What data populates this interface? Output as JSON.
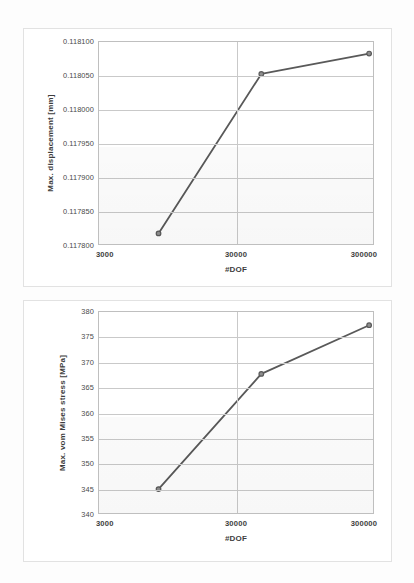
{
  "document": {
    "background_color": "#fdfdfd",
    "figure_count": 2
  },
  "chart_data": [
    {
      "id": "max-displacement-convergence",
      "type": "line",
      "title": "",
      "xlabel": "#DOF",
      "ylabel": "Max. displacement [mm]",
      "xscale": "log",
      "xlim": [
        3000,
        300000
      ],
      "ylim": [
        0.1178,
        0.1181
      ],
      "xticks": [
        3000,
        30000,
        300000
      ],
      "xtick_labels": [
        "3000",
        "30000",
        "300000"
      ],
      "yticks": [
        0.1178,
        0.11785,
        0.1179,
        0.11795,
        0.118,
        0.11805,
        0.1181
      ],
      "ytick_labels": [
        "0.117800",
        "0.117850",
        "0.117900",
        "0.117950",
        "0.118000",
        "0.118050",
        "0.118100"
      ],
      "grid": "horizontal-and-major-vertical",
      "legend": "none",
      "marker": "circle",
      "line_color": "#595959",
      "marker_color": "#595959",
      "series": [
        {
          "name": "Max. displacement",
          "x": [
            8100,
            45000,
            272000
          ],
          "y": [
            0.1178185,
            0.118053,
            0.118083
          ]
        }
      ]
    },
    {
      "id": "max-von-mises-stress-convergence",
      "type": "line",
      "title": "",
      "xlabel": "#DOF",
      "ylabel": "Max. vom Mises stress [MPa]",
      "xscale": "log",
      "xlim": [
        3000,
        300000
      ],
      "ylim": [
        340,
        380
      ],
      "xticks": [
        3000,
        30000,
        300000
      ],
      "xtick_labels": [
        "3000",
        "30000",
        "300000"
      ],
      "yticks": [
        340,
        345,
        350,
        355,
        360,
        365,
        370,
        375,
        380
      ],
      "ytick_labels": [
        "340",
        "345",
        "350",
        "355",
        "360",
        "365",
        "370",
        "375",
        "380"
      ],
      "grid": "horizontal-and-major-vertical",
      "legend": "none",
      "marker": "circle",
      "line_color": "#595959",
      "marker_color": "#595959",
      "series": [
        {
          "name": "Max. vom Mises stress",
          "x": [
            8100,
            45000,
            272000
          ],
          "y": [
            345.1,
            367.8,
            377.4
          ]
        }
      ]
    }
  ]
}
